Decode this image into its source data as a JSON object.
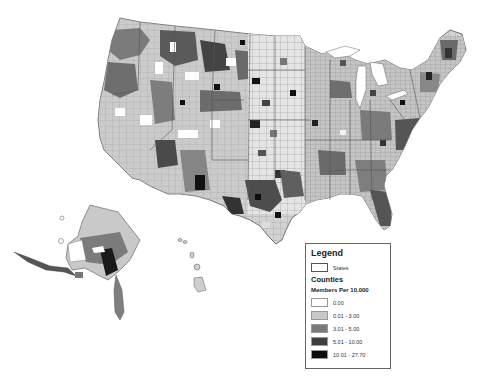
{
  "map": {
    "regions": [
      "Contiguous United States",
      "Alaska",
      "Hawaii"
    ],
    "unit": "counties",
    "metric": "Members Per 10,000"
  },
  "legend": {
    "title": "Legend",
    "states_label": "States",
    "counties_label": "Counties",
    "measure_label": "Members Per 10,000",
    "classes": [
      {
        "label": "0.00",
        "color": "#ffffff"
      },
      {
        "label": "0.01 - 3.00",
        "color": "#c8c8c8"
      },
      {
        "label": "3.01 - 5.00",
        "color": "#7a7a7a"
      },
      {
        "label": "5.01 - 10.00",
        "color": "#3f3f3f"
      },
      {
        "label": "10.01 - 27.70",
        "color": "#0d0d0d"
      }
    ]
  },
  "colors": {
    "state_border": "#555555",
    "county_border": "#8a8a8a",
    "background": "#ffffff"
  }
}
